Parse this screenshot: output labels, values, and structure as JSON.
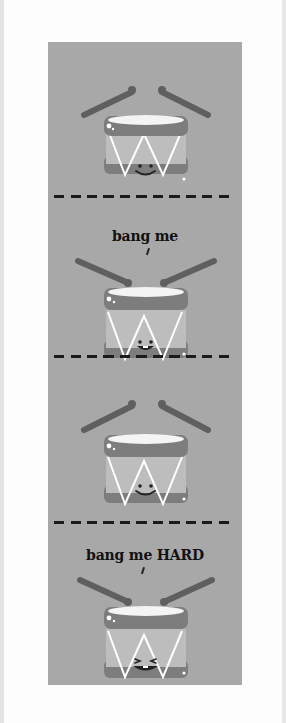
{
  "colors": {
    "background": "#fdfdfd",
    "panel": "#a8a8a8",
    "drum_rim": "#7d7d7d",
    "drum_body": "#bdbdbd",
    "drum_head": "#f4f4f4",
    "stick": "#5f5f5f",
    "zigzag": "#ffffff",
    "face": "#222222",
    "divider": "#1b1b1b",
    "caption": "#111111"
  },
  "panels": [
    {
      "caption": "",
      "face": "smile",
      "sticks": "raised"
    },
    {
      "caption": "bang me",
      "face": "open-smile",
      "sticks": "hitting"
    },
    {
      "caption": "",
      "face": "smile",
      "sticks": "raised"
    },
    {
      "caption": "bang me HARD",
      "face": "squint-grin",
      "sticks": "hitting"
    }
  ],
  "captions": {
    "panel2": "bang me",
    "panel4": "bang me HARD"
  }
}
